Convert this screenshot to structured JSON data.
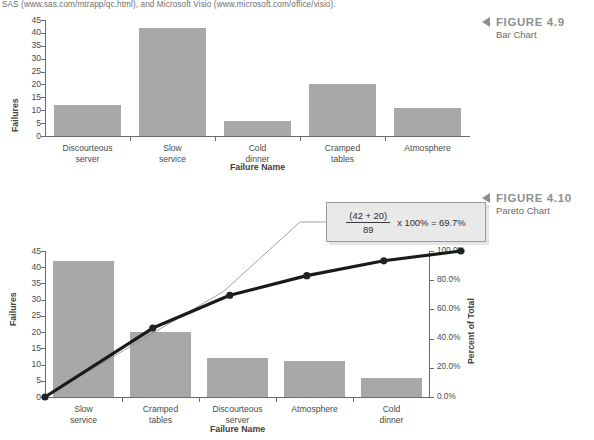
{
  "bodytext": "SAS (www.sas.com/mtrapp/qc.html), and Microsoft Visio (www.microsoft.com/office/visio).",
  "figures": [
    {
      "marker": "triangle-left",
      "number": "FIGURE 4.9",
      "title": "Bar Chart"
    },
    {
      "marker": "triangle-left",
      "number": "FIGURE 4.10",
      "title": "Pareto Chart"
    }
  ],
  "callout": {
    "numerator": "(42 + 20)",
    "denominator": "89",
    "expression": "x 100% = 69.7%"
  },
  "chart_data": [
    {
      "type": "bar",
      "title": "Bar Chart",
      "xlabel": "Failure Name",
      "ylabel": "Failures",
      "categories": [
        "Discourteous server",
        "Slow service",
        "Cold dinner",
        "Cramped tables",
        "Atmosphere"
      ],
      "category_lines": [
        [
          "Discourteous",
          "server"
        ],
        [
          "Slow",
          "service"
        ],
        [
          "Cold",
          "dinner"
        ],
        [
          "Cramped",
          "tables"
        ],
        [
          "Atmosphere"
        ]
      ],
      "values": [
        12,
        42,
        6,
        20,
        11
      ],
      "ylim": [
        0,
        45
      ],
      "yticks": [
        0,
        5,
        10,
        15,
        20,
        25,
        30,
        35,
        40,
        45
      ],
      "ytick_labels": [
        "0",
        "5",
        "10",
        "15",
        "20",
        "25",
        "30",
        "35",
        "40",
        "45"
      ],
      "grid": false,
      "legend": "none",
      "bar_color": "#a8a8a8"
    },
    {
      "type": "bar",
      "title": "Pareto Chart",
      "xlabel": "Failure Name",
      "ylabel": "Failures",
      "y2label": "Percent of Total",
      "categories": [
        "Slow service",
        "Cramped tables",
        "Discourteous server",
        "Atmosphere",
        "Cold dinner"
      ],
      "category_lines": [
        [
          "Slow",
          "service"
        ],
        [
          "Cramped",
          "tables"
        ],
        [
          "Discourteous",
          "server"
        ],
        [
          "Atmosphere"
        ],
        [
          "Cold",
          "dinner"
        ]
      ],
      "values": [
        42,
        20,
        12,
        11,
        6
      ],
      "ylim": [
        0,
        45
      ],
      "yticks": [
        0,
        5,
        10,
        15,
        20,
        25,
        30,
        35,
        40,
        45
      ],
      "ytick_labels": [
        "0",
        "5",
        "10",
        "15",
        "20",
        "25",
        "30",
        "35",
        "40",
        "45"
      ],
      "y2lim": [
        0,
        100
      ],
      "y2ticks": [
        0,
        20,
        40,
        60,
        80,
        100
      ],
      "y2tick_labels": [
        "0.0%",
        "20.0%",
        "40.0%",
        "60.0%",
        "80.0%",
        "100.0%"
      ],
      "cumulative_percent": [
        0.0,
        47.2,
        69.7,
        83.1,
        93.3,
        100.0
      ],
      "grid": false,
      "legend": "none",
      "bar_color": "#a8a8a8",
      "line_color": "#1a1a1a"
    }
  ]
}
